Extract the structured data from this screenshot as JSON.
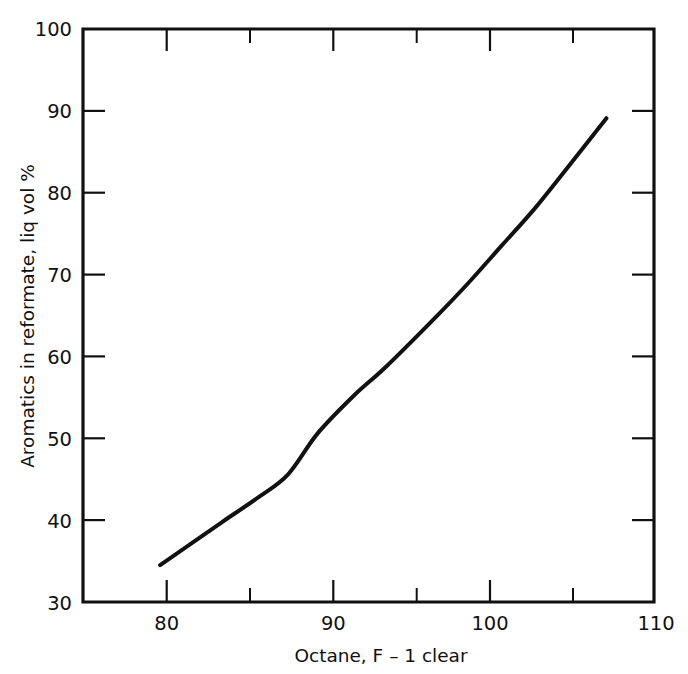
{
  "chart_data": {
    "type": "line",
    "title": "",
    "xlabel": "Octane, F – 1 clear",
    "ylabel": "Aromatics in reformate, liq vol %",
    "xlim": [
      75.5,
      110.3
    ],
    "ylim": [
      30,
      100
    ],
    "grid": false,
    "legend": "none",
    "x_major_ticks": [
      80,
      90,
      100,
      110
    ],
    "x_minor_ticks": [
      85,
      95,
      105
    ],
    "x_tick_labels": [
      "80",
      "90",
      "100",
      "110"
    ],
    "y_major_ticks": [
      30,
      40,
      50,
      60,
      70,
      80,
      90,
      100
    ],
    "y_tick_labels": [
      "30",
      "40",
      "50",
      "60",
      "70",
      "80",
      "90",
      "100"
    ],
    "series": [
      {
        "name": "Aromatics vs octane",
        "x": [
          80.2,
          82.0,
          84.0,
          86.2,
          88.0,
          89.8,
          92.0,
          94.0,
          97.0,
          99.0,
          101.0,
          103.0,
          105.0,
          107.4
        ],
        "values": [
          34.5,
          37.0,
          39.8,
          42.8,
          45.6,
          50.6,
          55.2,
          58.8,
          64.8,
          69.0,
          73.5,
          78.0,
          83.0,
          89.1
        ]
      }
    ],
    "annotations": []
  },
  "labels": {
    "y_axis_title": "Aromatics in reformate, liq vol %",
    "x_axis_title": "Octane, F – 1 clear",
    "y_100": "100",
    "y_90": "90",
    "y_80": "80",
    "y_70": "70",
    "y_60": "60",
    "y_50": "50",
    "y_40": "40",
    "y_30": "30",
    "x_80": "80",
    "x_90": "90",
    "x_100": "100",
    "x_110": "110"
  },
  "colors": {
    "background": "#ffffff",
    "ink": "#111111",
    "curve": "#111111"
  }
}
